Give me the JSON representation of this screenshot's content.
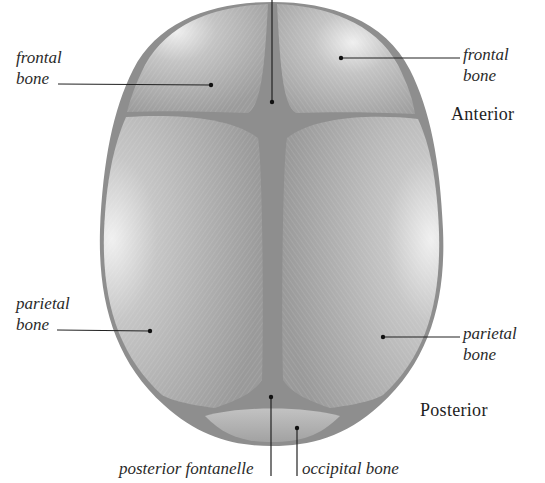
{
  "figure": {
    "colors": {
      "bone": "#a9a9a9",
      "bone_highlight": "#e8e8e8",
      "suture": "#8a8a8a",
      "leader_line": "#222222",
      "text": "#2a2a2a"
    }
  },
  "labels": {
    "frontal_left": {
      "line1": "frontal",
      "line2": "bone"
    },
    "frontal_right": {
      "line1": "frontal",
      "line2": "bone"
    },
    "parietal_left": {
      "line1": "parietal",
      "line2": "bone"
    },
    "parietal_right": {
      "line1": "parietal",
      "line2": "bone"
    },
    "posterior_fontanelle": "posterior fontanelle",
    "occipital_bone": "occipital bone"
  },
  "orientation": {
    "anterior": "Anterior",
    "posterior": "Posterior"
  }
}
